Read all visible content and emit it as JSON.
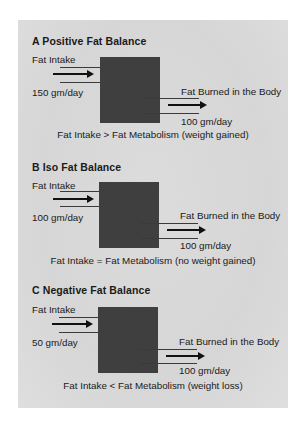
{
  "sections": [
    {
      "title": "A  Positive Fat Balance",
      "intake_label": "Fat Intake",
      "intake_value": "150 gm/day",
      "burn_label": "Fat Burned in the Body",
      "burn_value": "100 gm/day",
      "caption": "Fat Intake > Fat Metabolism (weight gained)"
    },
    {
      "title": "B  Iso Fat Balance",
      "intake_label": "Fat Intake",
      "intake_value": "100 gm/day",
      "burn_label": "Fat Burned in the Body",
      "burn_value": "100 gm/day",
      "caption": "Fat Intake = Fat Metabolism (no weight gained)"
    },
    {
      "title": "C  Negative Fat Balance",
      "intake_label": "Fat Intake",
      "intake_value": "50 gm/day",
      "burn_label": "Fat Burned in the Body",
      "burn_value": "100 gm/day",
      "caption": "Fat Intake < Fat Metabolism (weight loss)"
    }
  ],
  "colors": {
    "panel": "#d8d8d8",
    "box": "#3f3f3f",
    "text": "#1a1a1a"
  }
}
